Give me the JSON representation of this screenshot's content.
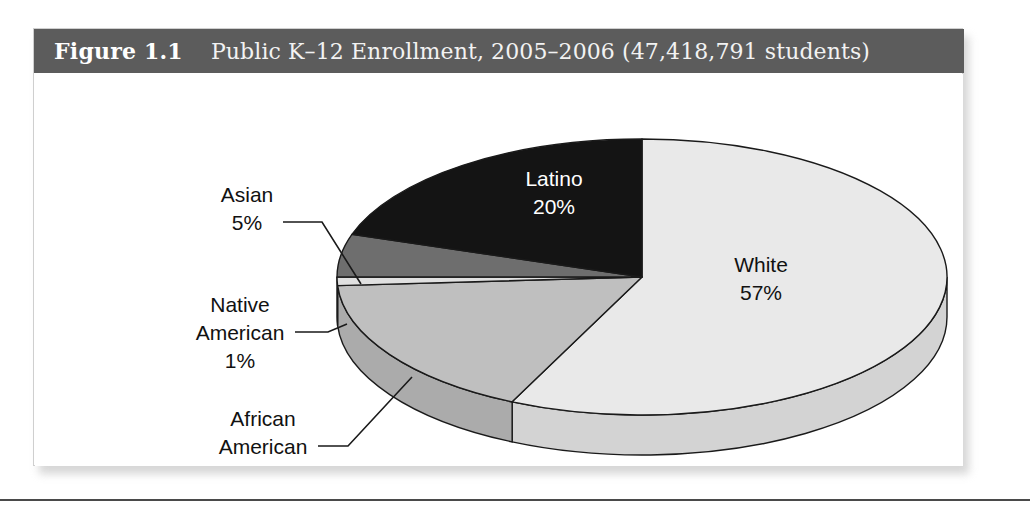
{
  "figure": {
    "number": "Figure 1.1",
    "caption": "Public K–12 Enrollment, 2005–2006 (47,418,791 students)",
    "header_bg": "#5c5c5c",
    "frame_border": "#cfcfcf"
  },
  "chart_data": {
    "type": "pie",
    "title": "Public K–12 Enrollment, 2005–2006 (47,418,791 students)",
    "total_label": "47,418,791 students",
    "total_value": 47418791,
    "units": "percent",
    "legend": "none (direct labels with leader lines)",
    "categories": [
      "White",
      "African American",
      "Native American",
      "Asian",
      "Latino"
    ],
    "values": [
      57,
      17,
      1,
      5,
      20
    ],
    "slices": [
      {
        "name": "White",
        "label": "White",
        "value_label": "57%",
        "value": 57,
        "color": "#e9e9e9",
        "side_color": "#d3d3d3",
        "text_color": "#111111",
        "label_placement": "inside",
        "label_x": 727,
        "label_y": 243
      },
      {
        "name": "Latino",
        "label": "Latino",
        "value_label": "20%",
        "value": 20,
        "color": "#141414",
        "side_color": "#141414",
        "text_color": "#ffffff",
        "label_placement": "inside",
        "label_x": 520,
        "label_y": 157
      },
      {
        "name": "African American",
        "label_line1": "African",
        "label_line2": "American",
        "value_label": "17%",
        "value": 17,
        "color": "#bfbfbf",
        "side_color": "#ababab",
        "text_color": "#111111",
        "label_placement": "outside-left",
        "label_x": 258,
        "label_y": 378
      },
      {
        "name": "Native American",
        "label_line1": "Native",
        "label_line2": "American",
        "value_label": "1%",
        "value": 1,
        "color": "#e0e0e0",
        "side_color": "#cccccc",
        "text_color": "#111111",
        "label_placement": "outside-left",
        "label_x": 205,
        "label_y": 268
      },
      {
        "name": "Asian",
        "label": "Asian",
        "value_label": "5%",
        "value": 5,
        "color": "#6e6e6e",
        "side_color": "#5a5a5a",
        "text_color": "#111111",
        "label_placement": "outside-left",
        "label_x": 212,
        "label_y": 157
      }
    ],
    "geometry": {
      "center_x": 608,
      "center_y": 248,
      "radius_x": 305,
      "radius_y": 138,
      "depth": 40,
      "start_angle_deg": -90,
      "direction": "clockwise"
    }
  }
}
